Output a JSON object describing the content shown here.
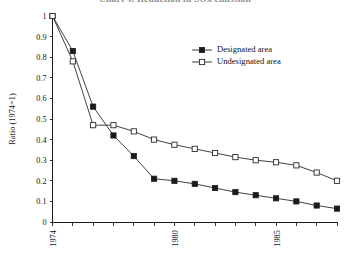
{
  "chart_data": {
    "type": "line",
    "title": "Chart 4. Reduction in SOx emission",
    "xlabel": "",
    "ylabel": "Ratio (1974=1)",
    "xlim": [
      1974,
      1988
    ],
    "ylim": [
      0,
      1
    ],
    "grid": false,
    "legend_position": "top-center-right",
    "x": [
      1974,
      1975,
      1976,
      1977,
      1978,
      1979,
      1980,
      1981,
      1982,
      1983,
      1984,
      1985,
      1986,
      1987,
      1988
    ],
    "ytick_labels": [
      "0",
      "0.1",
      "0.2",
      "0.3",
      "0.4",
      "0.5",
      "0.6",
      "0.7",
      "0.8",
      "0.9",
      "1"
    ],
    "ytick_values": [
      0,
      0.1,
      0.2,
      0.3,
      0.4,
      0.5,
      0.6,
      0.7,
      0.8,
      0.9,
      1
    ],
    "xtick_values": [
      1974,
      1975,
      1976,
      1977,
      1978,
      1979,
      1980,
      1981,
      1982,
      1983,
      1984,
      1985,
      1986,
      1987,
      1988
    ],
    "xtick_labels": [
      "1974",
      "",
      "",
      "",
      "",
      "",
      "1980",
      "",
      "",
      "",
      "",
      "1985",
      "",
      "",
      ""
    ],
    "series": [
      {
        "name": "Designated area",
        "marker": "filled-square",
        "values": [
          1.0,
          0.83,
          0.56,
          0.42,
          0.32,
          0.21,
          0.2,
          0.185,
          0.165,
          0.145,
          0.13,
          0.115,
          0.1,
          0.08,
          0.065
        ]
      },
      {
        "name": "Undesignated area",
        "marker": "open-square",
        "values": [
          1.0,
          0.78,
          0.47,
          0.47,
          0.44,
          0.4,
          0.375,
          0.355,
          0.335,
          0.315,
          0.3,
          0.29,
          0.275,
          0.24,
          0.2
        ]
      }
    ]
  },
  "legend": {
    "items": [
      {
        "label": "Designated area",
        "marker": "filled-square"
      },
      {
        "label": "Undesignated area",
        "marker": "open-square"
      }
    ]
  },
  "colors": {
    "axis": "#1a1a1a",
    "line": "#2b2b2b",
    "marker_fill": "#1b1b1b",
    "marker_open_fill": "#ffffff",
    "background": "#ffffff"
  }
}
